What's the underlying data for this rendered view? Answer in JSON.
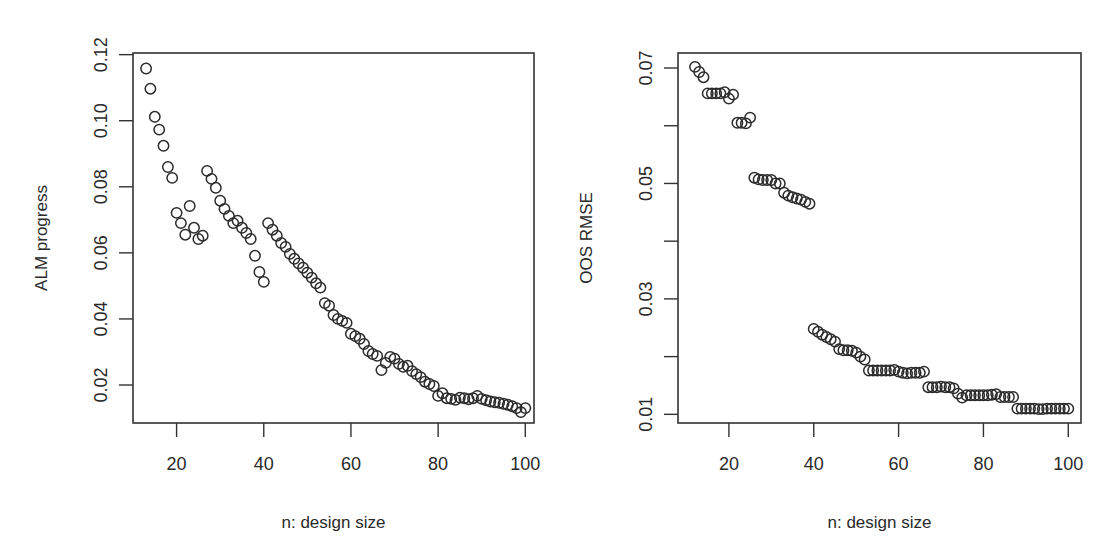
{
  "figure": {
    "panels": 2
  },
  "chart_data": [
    {
      "type": "scatter",
      "title": "",
      "xlabel": "n: design size",
      "ylabel": "ALM progress",
      "xlim": [
        10,
        102
      ],
      "ylim": [
        0.0085,
        0.1205
      ],
      "xticks": [
        20,
        40,
        60,
        80,
        100
      ],
      "xtick_labels": [
        "20",
        "40",
        "60",
        "80",
        "100"
      ],
      "yticks": [
        0.02,
        0.04,
        0.06,
        0.08,
        0.1,
        0.12
      ],
      "ytick_labels": [
        "0.02",
        "0.04",
        "0.06",
        "0.08",
        "0.10",
        "0.12"
      ],
      "grid": false,
      "legend": null,
      "marker": "open-circle",
      "frame_px": {
        "left": 133,
        "right": 534,
        "top": 53,
        "bottom": 423
      },
      "x": [
        13,
        14,
        15,
        16,
        17,
        18,
        19,
        20,
        21,
        22,
        23,
        24,
        25,
        26,
        27,
        28,
        29,
        30,
        31,
        32,
        33,
        34,
        35,
        36,
        37,
        38,
        39,
        40,
        41,
        42,
        43,
        44,
        45,
        46,
        47,
        48,
        49,
        50,
        51,
        52,
        53,
        54,
        55,
        56,
        57,
        58,
        59,
        60,
        61,
        62,
        63,
        64,
        65,
        66,
        67,
        68,
        69,
        70,
        71,
        72,
        73,
        74,
        75,
        76,
        77,
        78,
        79,
        80,
        81,
        82,
        83,
        84,
        85,
        86,
        87,
        88,
        89,
        90,
        91,
        92,
        93,
        94,
        95,
        96,
        97,
        98,
        99,
        100
      ],
      "y": [
        0.1158,
        0.1097,
        0.1012,
        0.0973,
        0.0924,
        0.086,
        0.0827,
        0.0721,
        0.069,
        0.0655,
        0.0742,
        0.0676,
        0.0642,
        0.0652,
        0.0848,
        0.0824,
        0.0797,
        0.0758,
        0.0733,
        0.0712,
        0.069,
        0.0697,
        0.0676,
        0.066,
        0.0642,
        0.0591,
        0.0542,
        0.0512,
        0.069,
        0.067,
        0.0652,
        0.063,
        0.0618,
        0.0597,
        0.0582,
        0.0568,
        0.0555,
        0.054,
        0.0525,
        0.0508,
        0.0495,
        0.0448,
        0.044,
        0.0412,
        0.04,
        0.0394,
        0.0388,
        0.0355,
        0.0348,
        0.034,
        0.0324,
        0.0303,
        0.0294,
        0.0288,
        0.0245,
        0.0267,
        0.0285,
        0.028,
        0.0264,
        0.0255,
        0.0258,
        0.0242,
        0.0233,
        0.0224,
        0.021,
        0.0203,
        0.0197,
        0.0167,
        0.0175,
        0.016,
        0.0158,
        0.0155,
        0.0162,
        0.016,
        0.0157,
        0.016,
        0.0167,
        0.0158,
        0.0154,
        0.015,
        0.0148,
        0.0146,
        0.0143,
        0.014,
        0.0136,
        0.013,
        0.0118,
        0.013
      ]
    },
    {
      "type": "scatter",
      "title": "",
      "xlabel": "n: design size",
      "ylabel": "OOS RMSE",
      "xlim": [
        8,
        103
      ],
      "ylim": [
        0.0085,
        0.0726
      ],
      "xticks": [
        20,
        40,
        60,
        80,
        100
      ],
      "xtick_labels": [
        "20",
        "40",
        "60",
        "80",
        "100"
      ],
      "yticks": [
        0.01,
        0.02,
        0.03,
        0.04,
        0.05,
        0.06,
        0.07
      ],
      "ytick_labels": [
        "0.01",
        "",
        "0.03",
        "",
        "0.05",
        "",
        "0.07"
      ],
      "grid": false,
      "legend": null,
      "marker": "open-circle",
      "frame_px": {
        "left": 678,
        "right": 1081,
        "top": 53,
        "bottom": 423
      },
      "x": [
        12,
        13,
        14,
        15,
        16,
        17,
        18,
        19,
        20,
        21,
        22,
        23,
        24,
        25,
        26,
        27,
        28,
        29,
        30,
        31,
        32,
        33,
        34,
        35,
        36,
        37,
        38,
        39,
        40,
        41,
        42,
        43,
        44,
        45,
        46,
        47,
        48,
        49,
        50,
        51,
        52,
        53,
        54,
        55,
        56,
        57,
        58,
        59,
        60,
        61,
        62,
        63,
        64,
        65,
        66,
        67,
        68,
        69,
        70,
        71,
        72,
        73,
        74,
        75,
        76,
        77,
        78,
        79,
        80,
        81,
        82,
        83,
        84,
        85,
        86,
        87,
        88,
        89,
        90,
        91,
        92,
        93,
        94,
        95,
        96,
        97,
        98,
        99,
        100
      ],
      "y": [
        0.0702,
        0.0693,
        0.0684,
        0.0656,
        0.0656,
        0.0656,
        0.0656,
        0.0658,
        0.0647,
        0.0654,
        0.0605,
        0.0605,
        0.0604,
        0.0614,
        0.051,
        0.0507,
        0.0506,
        0.0506,
        0.0506,
        0.05,
        0.05,
        0.0484,
        0.0479,
        0.0476,
        0.0474,
        0.0472,
        0.0468,
        0.0465,
        0.0248,
        0.0243,
        0.0238,
        0.0234,
        0.023,
        0.0226,
        0.0213,
        0.0211,
        0.0211,
        0.021,
        0.0207,
        0.02,
        0.0195,
        0.0176,
        0.0176,
        0.0176,
        0.0176,
        0.0176,
        0.0176,
        0.0177,
        0.0174,
        0.0172,
        0.0171,
        0.0172,
        0.0172,
        0.0172,
        0.0174,
        0.0147,
        0.0147,
        0.0147,
        0.0148,
        0.0147,
        0.0147,
        0.0145,
        0.0136,
        0.0129,
        0.0133,
        0.0133,
        0.0133,
        0.0133,
        0.0133,
        0.0133,
        0.0134,
        0.0135,
        0.013,
        0.013,
        0.013,
        0.013,
        0.011,
        0.011,
        0.011,
        0.011,
        0.011,
        0.0109,
        0.0109,
        0.011,
        0.011,
        0.011,
        0.011,
        0.011,
        0.011
      ]
    }
  ]
}
